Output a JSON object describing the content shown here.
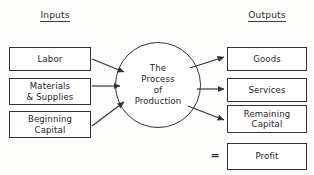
{
  "diagram": {
    "title_inputs": "Inputs",
    "title_outputs": "Outputs",
    "center": {
      "line1": "The",
      "line2": "Process",
      "line3": "of",
      "line4": "Production"
    },
    "inputs": [
      {
        "line1": "Labor",
        "line2": ""
      },
      {
        "line1": "Materials",
        "line2": "& Supplies"
      },
      {
        "line1": "Beginning",
        "line2": "Capital"
      }
    ],
    "outputs": [
      {
        "line1": "Goods",
        "line2": ""
      },
      {
        "line1": "Services",
        "line2": ""
      },
      {
        "line1": "Remaining",
        "line2": "Capital"
      },
      {
        "line1": "Profit",
        "line2": ""
      }
    ],
    "equals_symbol": "=",
    "colors": {
      "stroke": "#333333",
      "text": "#232323",
      "background": "#fdfdfc"
    }
  }
}
